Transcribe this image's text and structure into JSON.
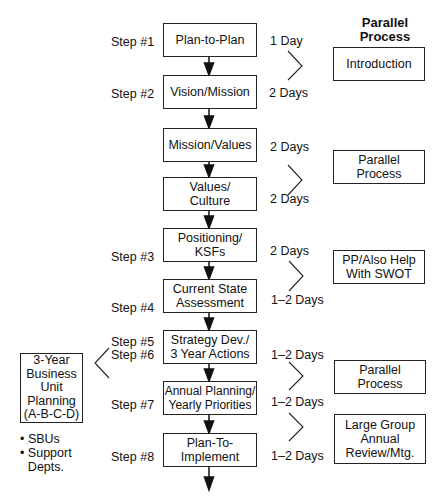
{
  "right_heading": "Parallel\nProcess",
  "main_steps": [
    {
      "step": "Step #1",
      "label": "Plan-to-Plan"
    },
    {
      "step": "Step #2",
      "label": "Vision/Mission"
    },
    {
      "step": "",
      "label": "Mission/Values"
    },
    {
      "step": "",
      "label": "Values/\nCulture"
    },
    {
      "step": "Step #3",
      "label": "Positioning/\nKSFs"
    },
    {
      "step": "Step #4",
      "label": "Current State\nAssessment"
    },
    {
      "step": "Step #5\nStep #6",
      "label": "Strategy Dev./\n3 Year Actions"
    },
    {
      "step": "Step #7",
      "label": "Annual Planning/\nYearly Priorities"
    },
    {
      "step": "Step #8",
      "label": "Plan-To-\nImplement"
    }
  ],
  "durations": [
    "1 Day",
    "2 Days",
    "2 Days",
    "2 Days",
    "2 Days",
    "1–2 Days",
    "1–2 Days",
    "1–2 Days",
    "1–2 Days"
  ],
  "parallel_boxes": [
    "Introduction",
    "Parallel\nProcess",
    "PP/Also Help\nWith SWOT",
    "Parallel\nProcess",
    "Large Group\nAnnual\nReview/Mtg."
  ],
  "left_box": {
    "label": "3-Year\nBusiness\nUnit\nPlanning\n(A-B-C-D)",
    "bullets": [
      "SBUs",
      "Support\nDepts."
    ]
  }
}
